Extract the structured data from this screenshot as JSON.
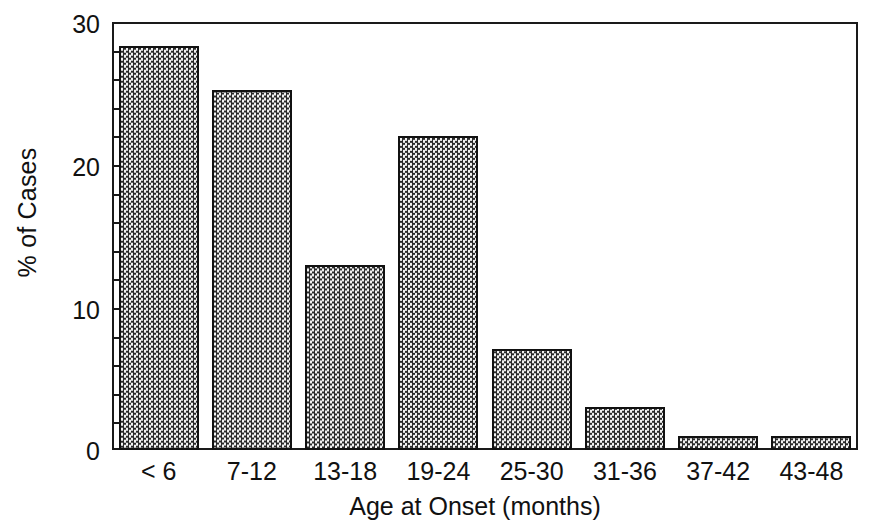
{
  "figure": {
    "background_color": "#ffffff",
    "ink_color": "#111111",
    "bar_fill_color": "#7a7a7a",
    "bar_edge_color": "#111111",
    "top_clipped_caption": ""
  },
  "chart_data": {
    "type": "bar",
    "title": "",
    "xlabel": "Age at Onset (months)",
    "ylabel": "% of Cases",
    "categories": [
      "< 6",
      "7-12",
      "13-18",
      "19-24",
      "25-30",
      "31-36",
      "37-42",
      "43-48"
    ],
    "values": [
      28.3,
      25.2,
      13.0,
      22.0,
      7.1,
      3.0,
      1.0,
      1.0
    ],
    "ylim": [
      0,
      30
    ],
    "yticks": [
      0,
      10,
      20,
      30
    ],
    "ytick_labels": [
      "0",
      "10",
      "20",
      "30"
    ],
    "yminor_tick_interval": 2,
    "grid": false,
    "legend": null,
    "bar_fill_pattern": "checkerboard-dither"
  },
  "axis": {
    "y_tick_labels": [
      "30",
      "20",
      "10",
      "0"
    ],
    "x_tick_labels": [
      "< 6",
      "7-12",
      "13-18",
      "19-24",
      "25-30",
      "31-36",
      "37-42",
      "43-48"
    ],
    "y_axis_title": "% of Cases",
    "x_axis_title": "Age at Onset (months)"
  }
}
